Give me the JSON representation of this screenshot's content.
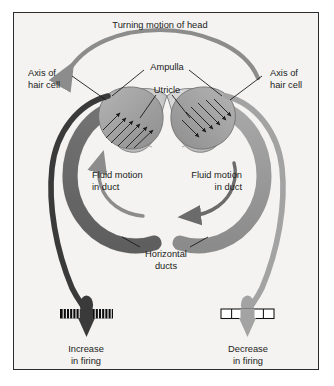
{
  "figure": {
    "title": "Turning motion of head",
    "background_color": "#f4f3f1",
    "border_color": "#2b2b2b"
  },
  "colors": {
    "duct_dark": "#6e6e6e",
    "duct_light": "#9a9a9a",
    "axon_dark": "#3a3a3a",
    "axon_light": "#a3a3a3",
    "utricle": "#c9c9c9",
    "ampulla_left": "#9d9d9d",
    "ampulla_right": "#8f8f8f",
    "head_arrow": "#8c8c8c",
    "fluid_arrow_left": "#8c8c8c",
    "fluid_arrow_right": "#6b6b6b",
    "text": "#1b1b1b"
  },
  "labels": {
    "head_motion": "Turning motion of head",
    "axis_left_line1": "Axis of",
    "axis_left_line2": "hair cell",
    "axis_right_line1": "Axis of",
    "axis_right_line2": "hair cell",
    "ampulla": "Ampulla",
    "utricle": "Utricle",
    "fluid_left_line1": "Fluid motion",
    "fluid_left_line2": "in duct",
    "fluid_right_line1": "Fluid motion",
    "fluid_right_line2": "in duct",
    "ducts_line1": "Horizontal",
    "ducts_line2": "ducts",
    "firing_left_line1": "Increase",
    "firing_left_line2": "in firing",
    "firing_right_line1": "Decrease",
    "firing_right_line2": "in firing"
  },
  "diagram_data": {
    "type": "anatomical-schematic",
    "subject": "Horizontal semicircular ducts and hair cell firing response to head rotation",
    "head_rotation_direction": "leftward",
    "sides": [
      {
        "side": "left",
        "duct_shade": "dark",
        "fluid_motion": "counter-clockwise (upward toward ampulla)",
        "hair_cell_state": "depolarized",
        "firing_response": "Increase in firing",
        "spike_train": {
          "style": "dense",
          "bar_count": 17,
          "fill": "black"
        }
      },
      {
        "side": "right",
        "duct_shade": "light",
        "fluid_motion": "counter-clockwise (downward away from ampulla)",
        "hair_cell_state": "hyperpolarized",
        "firing_response": "Decrease in firing",
        "spike_train": {
          "style": "sparse",
          "bar_count": 5,
          "fill": "white"
        }
      }
    ],
    "hair_cell_arrow_rows_left": 5,
    "hair_cell_arrow_rows_right": 5
  }
}
